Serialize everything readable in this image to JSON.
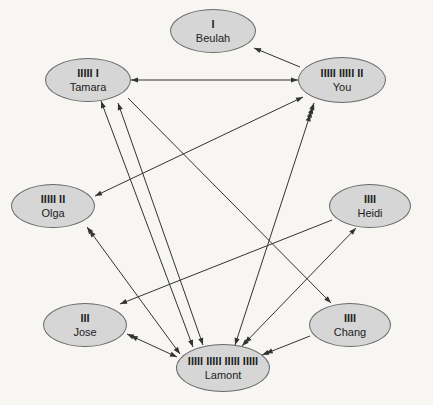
{
  "nodes": [
    {
      "id": "beulah",
      "name": "Beulah",
      "tally": "I",
      "count": 1,
      "cx": 213,
      "cy": 31,
      "w": 86,
      "h": 44
    },
    {
      "id": "tamara",
      "name": "Tamara",
      "tally": "IIIII I",
      "count": 6,
      "cx": 88,
      "cy": 80,
      "w": 86,
      "h": 44
    },
    {
      "id": "you",
      "name": "You",
      "tally": "IIIII IIIII II",
      "count": 12,
      "cx": 342,
      "cy": 80,
      "w": 88,
      "h": 46
    },
    {
      "id": "olga",
      "name": "Olga",
      "tally": "IIIII II",
      "count": 7,
      "cx": 53,
      "cy": 206,
      "w": 84,
      "h": 44
    },
    {
      "id": "heidi",
      "name": "Heidi",
      "tally": "IIII",
      "count": 4,
      "cx": 370,
      "cy": 206,
      "w": 82,
      "h": 44
    },
    {
      "id": "jose",
      "name": "Jose",
      "tally": "III",
      "count": 3,
      "cx": 85,
      "cy": 325,
      "w": 84,
      "h": 44
    },
    {
      "id": "chang",
      "name": "Chang",
      "tally": "IIII",
      "count": 4,
      "cx": 350,
      "cy": 325,
      "w": 82,
      "h": 44
    },
    {
      "id": "lamont",
      "name": "Lamont",
      "tally": "IIIII IIIII IIIII IIIII",
      "count": 20,
      "cx": 223,
      "cy": 368,
      "w": 94,
      "h": 48
    }
  ],
  "edges": [
    {
      "from": "you",
      "to": "beulah",
      "x1": 300,
      "y1": 67,
      "x2": 254,
      "y2": 48,
      "head_end": 1,
      "head_start": 0
    },
    {
      "from": "tamara",
      "to": "you",
      "x1": 131,
      "y1": 80,
      "x2": 298,
      "y2": 80,
      "head_end": 1,
      "head_start": 1
    },
    {
      "from": "olga",
      "to": "you",
      "x1": 95,
      "y1": 196,
      "x2": 303,
      "y2": 97,
      "head_end": 1,
      "head_start": 1
    },
    {
      "from": "lamont",
      "to": "you",
      "x1": 235,
      "y1": 345,
      "x2": 314,
      "y2": 103,
      "head_end": 4,
      "head_start": 1
    },
    {
      "from": "lamont",
      "to": "tamara",
      "x1": 203,
      "y1": 345,
      "x2": 118,
      "y2": 103,
      "head_end": 1,
      "head_start": 1
    },
    {
      "from": "lamont",
      "to": "tamara",
      "x1": 193,
      "y1": 347,
      "x2": 101,
      "y2": 101,
      "head_end": 1,
      "head_start": 1
    },
    {
      "from": "tamara",
      "to": "chang",
      "x1": 128,
      "y1": 98,
      "x2": 331,
      "y2": 303,
      "head_end": 1,
      "head_start": 0
    },
    {
      "from": "olga",
      "to": "lamont",
      "x1": 87,
      "y1": 227,
      "x2": 180,
      "y2": 354,
      "head_end": 1,
      "head_start": 2
    },
    {
      "from": "heidi",
      "to": "jose",
      "x1": 332,
      "y1": 220,
      "x2": 120,
      "y2": 304,
      "head_end": 1,
      "head_start": 0
    },
    {
      "from": "jose",
      "to": "lamont",
      "x1": 127,
      "y1": 334,
      "x2": 177,
      "y2": 357,
      "head_end": 1,
      "head_start": 2
    },
    {
      "from": "chang",
      "to": "lamont",
      "x1": 310,
      "y1": 336,
      "x2": 262,
      "y2": 355,
      "head_end": 2,
      "head_start": 0
    },
    {
      "from": "heidi",
      "to": "lamont",
      "x1": 356,
      "y1": 228,
      "x2": 242,
      "y2": 346,
      "head_end": 2,
      "head_start": 1
    }
  ],
  "colors": {
    "node_fill": "#d6d6d6",
    "node_stroke": "#6a6a6a",
    "edge": "#333333",
    "background": "#f7f6f3"
  }
}
